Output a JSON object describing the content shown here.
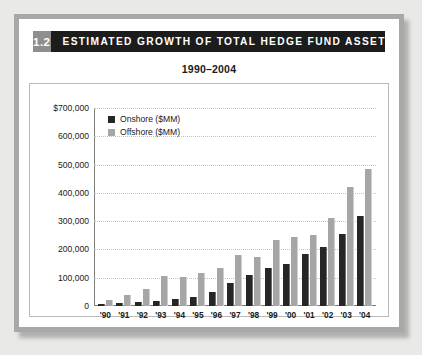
{
  "exhibit": {
    "number": "1.2",
    "title": "ESTIMATED GROWTH OF TOTAL HEDGE FUND ASSETS"
  },
  "colors": {
    "onshore": "#262626",
    "offshore": "#a6a6a4",
    "title_band": "#1c1c1c",
    "number_badge": "#8e8e8c",
    "frame": "#a8a8a6",
    "page_background": "#e9e9e7"
  },
  "chart_data": {
    "type": "bar",
    "title": "1990–2004",
    "subtitle": "1990–2004",
    "xlabel": "",
    "ylabel": "",
    "ylim": [
      0,
      700000
    ],
    "yticks": [
      0,
      100000,
      200000,
      300000,
      400000,
      500000,
      600000,
      700000
    ],
    "ytick_labels": [
      "0",
      "100,000",
      "200,000",
      "300,000",
      "400,000",
      "500,000",
      "600,000",
      "$700,000"
    ],
    "grid": true,
    "legend_position": "upper left",
    "categories": [
      "'90",
      "'91",
      "'92",
      "'93",
      "'94",
      "'95",
      "'96",
      "'97",
      "'98",
      "'99",
      "'00",
      "'01",
      "'02",
      "'03",
      "'04"
    ],
    "series": [
      {
        "name": "Onshore ($MM)",
        "color": "#262626",
        "values": [
          7000,
          10000,
          14000,
          19000,
          25000,
          32000,
          50000,
          80000,
          110000,
          135000,
          150000,
          185000,
          210000,
          255000,
          320000
        ]
      },
      {
        "name": "Offshore ($MM)",
        "color": "#a6a6a4",
        "values": [
          23000,
          38000,
          60000,
          105000,
          103000,
          115000,
          135000,
          180000,
          175000,
          235000,
          245000,
          250000,
          310000,
          420000,
          485000
        ]
      }
    ]
  }
}
